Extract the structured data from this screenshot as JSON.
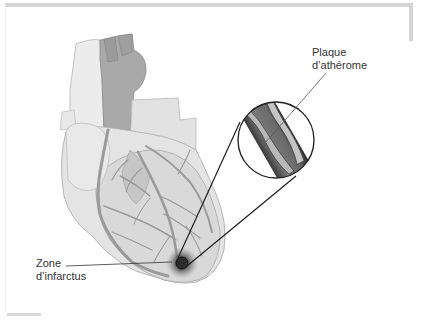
{
  "diagram": {
    "labels": {
      "plaque": {
        "line1": "Plaque",
        "line2": "d’athérome"
      },
      "zone": {
        "line1": "Zone",
        "line2": "d’infarctus"
      }
    },
    "colors": {
      "frame": "#d4d4d4",
      "heart_light": "#e6e6e6",
      "heart_mid": "#cfcfcf",
      "vessel": "#9a9a9a",
      "artery_dark": "#8c8c8c",
      "leader_line": "#222222",
      "infarct": "#3a3a3a"
    }
  }
}
